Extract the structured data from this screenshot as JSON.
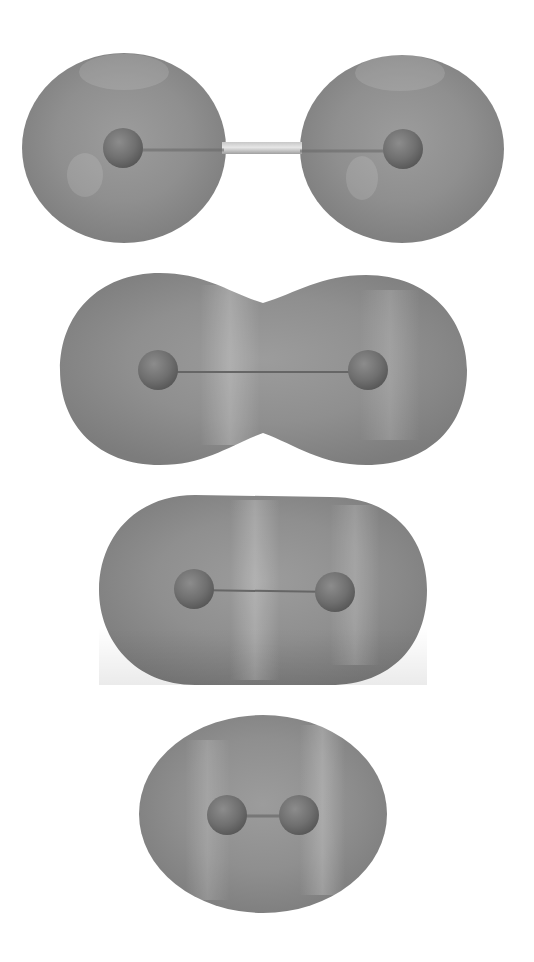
{
  "figure": {
    "background": "#ffffff",
    "surface_color": "#8e8e8e",
    "surface_highlight": "#b4b4b4",
    "surface_shadow": "#7a7a7a",
    "atom_color": "#6e6e6e",
    "atom_highlight": "#9a9a9a",
    "bond_color": "#5e5e5e",
    "panels": [
      {
        "id": "separated",
        "description": "Two separate spherical electron clouds, atoms far apart connected by a thin bond",
        "atoms": [
          {
            "x": 123,
            "y": 148,
            "r": 20
          },
          {
            "x": 403,
            "y": 149,
            "r": 20
          }
        ],
        "lobes": [
          {
            "cx": 124,
            "cy": 148,
            "rx": 102,
            "ry": 95
          },
          {
            "cx": 402,
            "cy": 149,
            "rx": 102,
            "ry": 94
          }
        ],
        "bond_visible_between": [
          224,
          300
        ]
      },
      {
        "id": "merging",
        "description": "Clouds merging into a peanut shape with a neck",
        "atoms": [
          {
            "x": 158,
            "y": 370,
            "r": 20
          },
          {
            "x": 368,
            "y": 370,
            "r": 20
          }
        ],
        "bounds": {
          "left": 60,
          "right": 467,
          "top": 273,
          "bottom": 465
        },
        "neck": {
          "top": 303,
          "bottom": 433
        }
      },
      {
        "id": "bonded",
        "description": "Single elongated capsule-shaped cloud",
        "atoms": [
          {
            "x": 194,
            "y": 589,
            "r": 20
          },
          {
            "x": 335,
            "y": 592,
            "r": 20
          }
        ],
        "bounds": {
          "left": 99,
          "right": 427,
          "top": 495,
          "bottom": 685
        }
      },
      {
        "id": "compressed",
        "description": "Compact ellipsoidal cloud with atoms close together",
        "atoms": [
          {
            "x": 227,
            "y": 815,
            "r": 20
          },
          {
            "x": 299,
            "y": 815,
            "r": 20
          }
        ],
        "bounds": {
          "left": 139,
          "right": 387,
          "top": 715,
          "bottom": 913
        }
      }
    ]
  }
}
